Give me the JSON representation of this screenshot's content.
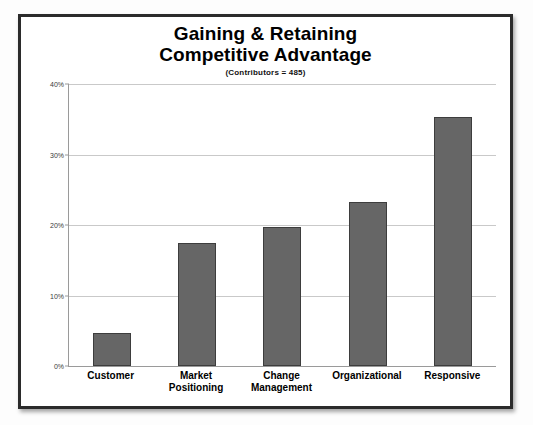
{
  "chart_data": {
    "type": "bar",
    "title": "Gaining & Retaining Competitive Advantage",
    "title_lines": [
      "Gaining & Retaining",
      "Competitive Advantage"
    ],
    "subtitle": "(Contributors = 485)",
    "categories": [
      "Customer",
      "Market Positioning",
      "Change Management",
      "Organizational",
      "Responsive"
    ],
    "category_lines": [
      [
        "Customer"
      ],
      [
        "Market",
        "Positioning"
      ],
      [
        "Change",
        "Management"
      ],
      [
        "Organizational"
      ],
      [
        "Responsive"
      ]
    ],
    "values": [
      4.7,
      17.5,
      19.7,
      23.3,
      35.3
    ],
    "xlabel": "",
    "ylabel": "",
    "ylim": [
      0,
      40
    ],
    "ytick_values": [
      0,
      10,
      20,
      30,
      40
    ],
    "ytick_labels": [
      "0%",
      "10%",
      "20%",
      "30%",
      "40%"
    ],
    "grid": true,
    "legend": false,
    "bar_color": "#666666",
    "bar_border_color": "#3d3d3d",
    "gridline_color": "#c9c9c9",
    "axis_color": "#9a9a9a",
    "frame_color": "#2b2b2b",
    "background_color": "#ffffff"
  }
}
